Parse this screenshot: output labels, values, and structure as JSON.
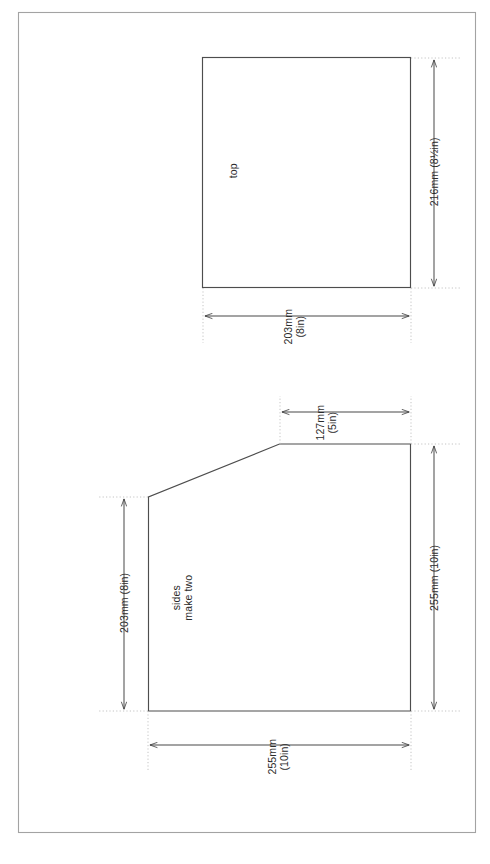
{
  "drawing": {
    "title": "woodwork pattern sheet",
    "orientation": "rotated-90-ccw",
    "line_color": "#4a4a4a",
    "extension_line_color": "#b9b9b9",
    "border_color": "#9a9a9a",
    "background": "#ffffff",
    "page_border": {
      "name": "page-border",
      "x": 18,
      "y": 12,
      "width": 458,
      "height": 821
    },
    "parts": [
      {
        "id": "top",
        "label": "top",
        "shape": "rectangle",
        "dimensions": [
          {
            "id": "top-height",
            "value_mm": "216mm",
            "value_in": "(8½in)",
            "text": "216mm (8½in)",
            "lines": [
              "216mm (8½in)"
            ],
            "orientation": "vertical"
          },
          {
            "id": "top-width",
            "value_mm": "203mm",
            "value_in": "(8in)",
            "text": "203mm (8in)",
            "lines": [
              "203mm",
              "(8in)"
            ],
            "orientation": "horizontal"
          }
        ]
      },
      {
        "id": "sides",
        "label_lines": [
          "sides",
          "make two"
        ],
        "label": "sides make two",
        "shape": "pentagon",
        "dimensions": [
          {
            "id": "sides-top-edge",
            "value_mm": "127mm",
            "value_in": "(5in)",
            "text": "127mm (5in)",
            "lines": [
              "127mm",
              "(5in)"
            ],
            "orientation": "horizontal"
          },
          {
            "id": "sides-left-edge",
            "value_mm": "203mm",
            "value_in": "(8in)",
            "text": "203mm (8in)",
            "lines": [
              "203mm (8in)"
            ],
            "orientation": "vertical"
          },
          {
            "id": "sides-right-edge",
            "value_mm": "255mm",
            "value_in": "(10in)",
            "text": "255mm (10in)",
            "lines": [
              "255mm (10in)"
            ],
            "orientation": "vertical"
          },
          {
            "id": "sides-bottom-edge",
            "value_mm": "255mm",
            "value_in": "(10in)",
            "text": "255mm (10in)",
            "lines": [
              "255mm",
              "(10in)"
            ],
            "orientation": "horizontal"
          }
        ]
      }
    ]
  },
  "labels": {
    "top_part": "top",
    "top_height": "216mm (8½in)",
    "top_width_line1": "203mm",
    "top_width_line2": "(8in)",
    "sides_part_line1": "sides",
    "sides_part_line2": "make two",
    "sides_top_line1": "127mm",
    "sides_top_line2": "(5in)",
    "sides_left": "203mm (8in)",
    "sides_right": "255mm (10in)",
    "sides_bottom_line1": "255mm",
    "sides_bottom_line2": "(10in)"
  }
}
